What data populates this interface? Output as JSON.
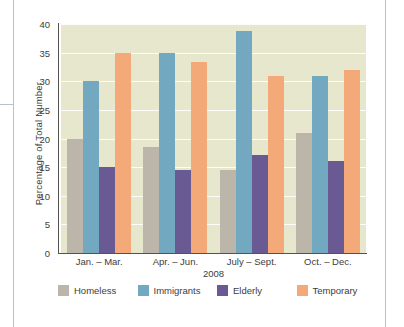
{
  "chart_data": {
    "type": "bar",
    "title": "",
    "xlabel": "2008",
    "ylabel": "Percentage of Total Number",
    "categories": [
      "Jan. – Mar.",
      "Apr. – Jun.",
      "July – Sept.",
      "Oct. – Dec."
    ],
    "series": [
      {
        "name": "Homeless",
        "color": "#bcb6aa",
        "values": [
          20,
          18.5,
          14.5,
          21
        ]
      },
      {
        "name": "Immigrants",
        "color": "#72a9c0",
        "values": [
          30,
          35,
          38.8,
          31
        ]
      },
      {
        "name": "Elderly",
        "color": "#6a5a93",
        "values": [
          15,
          14.5,
          17.2,
          16
        ]
      },
      {
        "name": "Temporary",
        "color": "#f4a978",
        "values": [
          35,
          33.4,
          31,
          32
        ]
      }
    ],
    "ylim": [
      0,
      40
    ],
    "yticks": [
      0,
      5,
      10,
      15,
      20,
      25,
      30,
      35,
      40
    ],
    "ytick_labels": [
      "0",
      "5",
      "10",
      "15",
      "20",
      "25",
      "30",
      "35",
      "40"
    ],
    "grid": true,
    "legend_position": "bottom",
    "plot_background": "#e6e7cc"
  },
  "legend": {
    "items": [
      {
        "label": "Homeless",
        "color": "#bcb6aa"
      },
      {
        "label": "Immigrants",
        "color": "#72a9c0"
      },
      {
        "label": "Elderly",
        "color": "#6a5a93"
      },
      {
        "label": "Temporary",
        "color": "#f4a978"
      }
    ]
  }
}
